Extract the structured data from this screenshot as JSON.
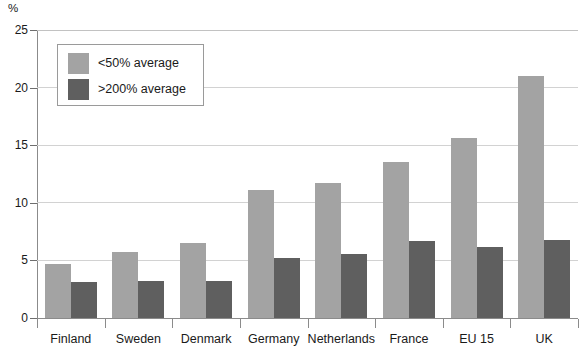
{
  "chart_data": {
    "type": "bar",
    "title": "",
    "subtitle": "",
    "xlabel": "",
    "ylabel": "%",
    "ylim": [
      0,
      25
    ],
    "yticks": [
      0,
      5,
      10,
      15,
      20,
      25
    ],
    "ytick_labels": [
      "0",
      "5",
      "10",
      "15",
      "20",
      "25"
    ],
    "grid": true,
    "grid_axis": "y",
    "legend_position": "upper left",
    "categories": [
      "Finland",
      "Sweden",
      "Denmark",
      "Germany",
      "Netherlands",
      "France",
      "EU 15",
      "UK"
    ],
    "series": [
      {
        "name": "<50% average",
        "color": "#a3a3a3",
        "values": [
          4.7,
          5.7,
          6.5,
          11.1,
          11.7,
          13.5,
          15.6,
          21.0
        ]
      },
      {
        "name": ">200% average",
        "color": "#5f5f5f",
        "values": [
          3.1,
          3.2,
          3.2,
          5.2,
          5.6,
          6.7,
          6.2,
          6.8
        ]
      }
    ]
  },
  "axis": {
    "unit_label": "%"
  },
  "legend": {
    "entries": [
      {
        "label": "<50% average",
        "swatch": "light"
      },
      {
        "label": ">200% average",
        "swatch": "dark"
      }
    ]
  },
  "colors": {
    "light_bar": "#a3a3a3",
    "dark_bar": "#5f5f5f",
    "axis": "#8b8b8b",
    "grid": "#d2d2d2",
    "text": "#1a1a1a",
    "background": "#ffffff"
  }
}
